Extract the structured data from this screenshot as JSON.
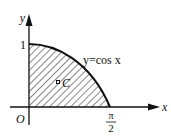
{
  "diagram": {
    "axis_labels": {
      "x": "x",
      "y": "y",
      "origin": "O"
    },
    "tick_labels": {
      "y_one": "1",
      "x_pi_num": "π",
      "x_pi_den": "2"
    },
    "curve_label": "y=cos x",
    "centroid_label": "C",
    "colors": {
      "ink": "#111111",
      "background": "#ffffff"
    }
  }
}
